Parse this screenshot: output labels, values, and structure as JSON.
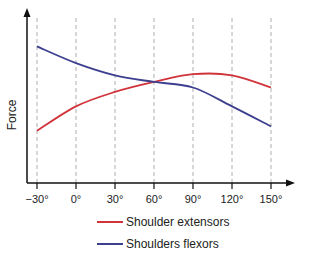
{
  "chart_data": {
    "type": "line",
    "title": "",
    "xlabel": "",
    "ylabel": "Force",
    "x": [
      -30,
      0,
      30,
      60,
      90,
      120,
      150
    ],
    "categories": [
      "−30°",
      "0°",
      "30°",
      "60°",
      "90°",
      "120°",
      "150°"
    ],
    "ylim": [
      0,
      100
    ],
    "grid": "vertical dashed",
    "legend_position": "bottom",
    "series": [
      {
        "name": "Shoulder extensors",
        "color": "#d0343a",
        "values": [
          20,
          42,
          55,
          64,
          71,
          70,
          59
        ]
      },
      {
        "name": "Shoulders flexors",
        "color": "#3d3f8f",
        "values": [
          96,
          81,
          70,
          64,
          59,
          42,
          24
        ]
      }
    ]
  },
  "legend": {
    "items": [
      {
        "label": "Shoulder extensors",
        "color": "#d0343a"
      },
      {
        "label": "Shoulders flexors",
        "color": "#3d3f8f"
      }
    ]
  }
}
